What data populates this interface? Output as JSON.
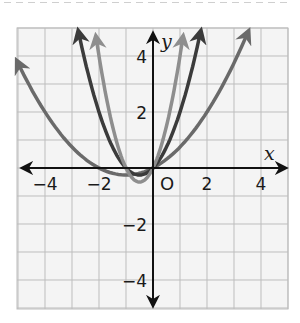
{
  "chart_data": {
    "type": "line",
    "title": "",
    "xlabel": "x",
    "ylabel": "y",
    "origin_label": "O",
    "xlim": [
      -5,
      5
    ],
    "ylim": [
      -5,
      5
    ],
    "grid": true,
    "x_ticks": [
      {
        "value": -4,
        "label": "−4"
      },
      {
        "value": -2,
        "label": "−2"
      },
      {
        "value": 2,
        "label": "2"
      },
      {
        "value": 4,
        "label": "4"
      }
    ],
    "y_ticks": [
      {
        "value": 4,
        "label": "4"
      },
      {
        "value": 2,
        "label": "2"
      },
      {
        "value": -2,
        "label": "−2"
      },
      {
        "value": -4,
        "label": "−4"
      }
    ],
    "series": [
      {
        "name": "y = 0.25x² + 0.5x",
        "a": 0.25,
        "b": 0.5,
        "c": 0,
        "x_range": [
          -5,
          3.5
        ],
        "color": "#6a6a6a"
      },
      {
        "name": "y = x² + x",
        "a": 1,
        "b": 1,
        "c": 0,
        "x_range": [
          -2.75,
          1.75
        ],
        "color": "#3b3b3b"
      },
      {
        "name": "y = 2x² + 2x",
        "a": 2,
        "b": 2,
        "c": 0,
        "x_range": [
          -2.1,
          1.1
        ],
        "color": "#8e8e8e"
      }
    ],
    "legend": null
  }
}
